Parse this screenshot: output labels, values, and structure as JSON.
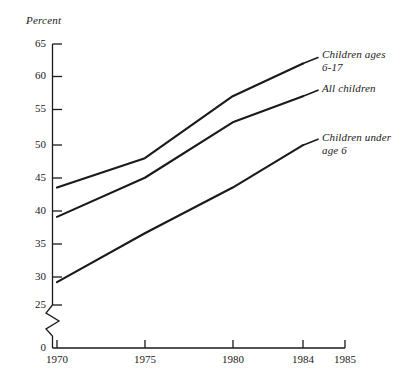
{
  "chart_data": {
    "type": "line",
    "title": "",
    "ylabel": "Percent",
    "xlabel": "",
    "x": [
      1970,
      1975,
      1980,
      1984
    ],
    "xlim": [
      1969,
      1985.6
    ],
    "ylim": [
      25,
      65
    ],
    "y_axis_break": true,
    "y_break_values": [
      0,
      25
    ],
    "grid": false,
    "legend_position": "right-inline",
    "series": [
      {
        "name": "Children ages 6-17",
        "values": [
          43.0,
          47.5,
          57.0,
          62.0
        ],
        "color": "#1a1a1a"
      },
      {
        "name": "All children",
        "values": [
          38.5,
          44.5,
          53.0,
          57.0
        ],
        "color": "#1a1a1a"
      },
      {
        "name": "Children under age 6",
        "values": [
          28.5,
          36.0,
          43.0,
          49.5
        ],
        "color": "#1a1a1a"
      }
    ],
    "ytick_labels": [
      "0",
      "25",
      "30",
      "35",
      "40",
      "45",
      "50",
      "55",
      "60",
      "65"
    ],
    "xtick_labels": [
      "1970",
      "1975",
      "1980",
      "1984",
      "1985"
    ]
  },
  "axis": {
    "y_title": "Percent",
    "yticks": [
      {
        "label": "65",
        "value": 65
      },
      {
        "label": "60",
        "value": 60
      },
      {
        "label": "55",
        "value": 55
      },
      {
        "label": "50",
        "value": 50
      },
      {
        "label": "45",
        "value": 45
      },
      {
        "label": "40",
        "value": 40
      },
      {
        "label": "35",
        "value": 35
      },
      {
        "label": "30",
        "value": 30
      },
      {
        "label": "25",
        "value": 25
      },
      {
        "label": "0",
        "value": 0
      }
    ],
    "xticks": [
      {
        "label": "1970",
        "value": 1970
      },
      {
        "label": "1975",
        "value": 1975
      },
      {
        "label": "1980",
        "value": 1980
      },
      {
        "label": "1984",
        "value": 1984
      },
      {
        "label": "1985",
        "value": 1985
      }
    ]
  },
  "legend": {
    "items": [
      {
        "label": "Children ages\n6-17"
      },
      {
        "label": "All children"
      },
      {
        "label": "Children under\nage 6"
      }
    ]
  }
}
